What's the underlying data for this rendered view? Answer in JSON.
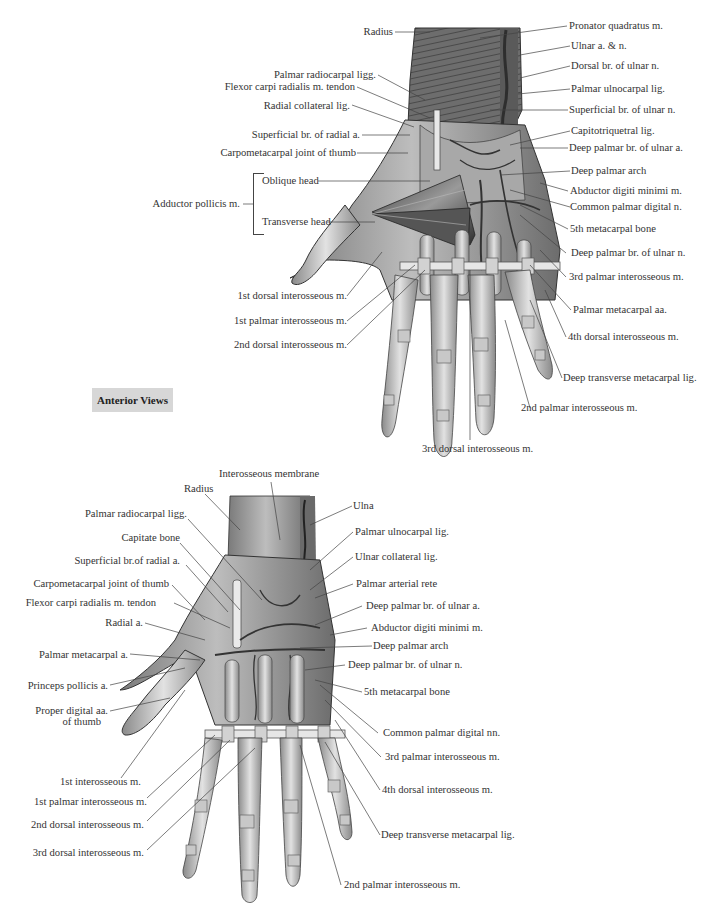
{
  "figure": {
    "view_badge": "Anterior Views",
    "top_view": {
      "labels_left": [
        {
          "id": "radius",
          "text": "Radius"
        },
        {
          "id": "palmar-radiocarpal-ligg",
          "text": "Palmar radiocarpal ligg."
        },
        {
          "id": "flexor-carpi-radialis-tendon",
          "text": "Flexor carpi radialis m. tendon"
        },
        {
          "id": "radial-collateral-lig",
          "text": "Radial collateral lig."
        },
        {
          "id": "superficial-br-radial-a",
          "text": "Superficial br. of radial a."
        },
        {
          "id": "carpometacarpal-joint-thumb",
          "text": "Carpometacarpal joint of thumb"
        },
        {
          "id": "adductor-pollicis",
          "text": "Adductor pollicis m."
        },
        {
          "id": "oblique-head",
          "text": "Oblique head"
        },
        {
          "id": "transverse-head",
          "text": "Transverse head"
        },
        {
          "id": "1st-dorsal-interosseous",
          "text": "1st dorsal interosseous m."
        },
        {
          "id": "1st-palmar-interosseous",
          "text": "1st palmar interosseous m."
        },
        {
          "id": "2nd-dorsal-interosseous",
          "text": "2nd dorsal interosseous m."
        }
      ],
      "labels_right": [
        {
          "id": "pronator-quadratus",
          "text": "Pronator quadratus m."
        },
        {
          "id": "ulnar-a-n",
          "text": "Ulnar a. & n."
        },
        {
          "id": "dorsal-br-ulnar-n",
          "text": "Dorsal br. of ulnar n."
        },
        {
          "id": "palmar-ulnocarpal-lig",
          "text": "Palmar ulnocarpal lig."
        },
        {
          "id": "superficial-br-ulnar-n",
          "text": "Superficial br. of ulnar n."
        },
        {
          "id": "capitotriquetral-lig",
          "text": "Capitotriquetral lig."
        },
        {
          "id": "deep-palmar-br-ulnar-a",
          "text": "Deep palmar br. of ulnar a."
        },
        {
          "id": "deep-palmar-arch",
          "text": "Deep palmar arch"
        },
        {
          "id": "abductor-digiti-minimi",
          "text": "Abductor digiti minimi m."
        },
        {
          "id": "common-palmar-digital-n",
          "text": "Common palmar digital n."
        },
        {
          "id": "5th-metacarpal-bone",
          "text": "5th metacarpal bone"
        },
        {
          "id": "deep-palmar-br-ulnar-n",
          "text": "Deep palmar br. of ulnar n."
        },
        {
          "id": "3rd-palmar-interosseous",
          "text": "3rd palmar interosseous m."
        },
        {
          "id": "palmar-metacarpal-aa",
          "text": "Palmar metacarpal aa."
        },
        {
          "id": "4th-dorsal-interosseous",
          "text": "4th dorsal interosseous m."
        },
        {
          "id": "deep-transverse-metacarpal-lig",
          "text": "Deep transverse metacarpal lig."
        },
        {
          "id": "2nd-palmar-interosseous",
          "text": "2nd palmar interosseous m."
        }
      ],
      "labels_bottom": [
        {
          "id": "3rd-dorsal-interosseous",
          "text": "3rd dorsal interosseous m."
        }
      ]
    },
    "bottom_view": {
      "labels_top": [
        {
          "id": "interosseous-membrane",
          "text": "Interosseous membrane"
        },
        {
          "id": "radius",
          "text": "Radius"
        }
      ],
      "labels_left": [
        {
          "id": "palmar-radiocarpal-ligg",
          "text": "Palmar radiocarpal ligg."
        },
        {
          "id": "capitate-bone",
          "text": "Capitate bone"
        },
        {
          "id": "superficial-br-radial-a",
          "text": "Superficial br.of radial a."
        },
        {
          "id": "carpometacarpal-joint-thumb",
          "text": "Carpometacarpal joint of thumb"
        },
        {
          "id": "flexor-carpi-radialis-tendon",
          "text": "Flexor carpi radialis m. tendon"
        },
        {
          "id": "radial-a",
          "text": "Radial a."
        },
        {
          "id": "palmar-metacarpal-a",
          "text": "Palmar metacarpal a."
        },
        {
          "id": "princeps-pollicis-a",
          "text": "Princeps pollicis a."
        },
        {
          "id": "proper-digital-aa-thumb-1",
          "text": "Proper digital aa."
        },
        {
          "id": "proper-digital-aa-thumb-2",
          "text": "of thumb"
        },
        {
          "id": "1st-interosseous",
          "text": "1st interosseous m."
        },
        {
          "id": "1st-palmar-interosseous",
          "text": "1st palmar interosseous m."
        },
        {
          "id": "2nd-dorsal-interosseous",
          "text": "2nd dorsal interosseous m."
        },
        {
          "id": "3rd-dorsal-interosseous",
          "text": "3rd dorsal interosseous m."
        }
      ],
      "labels_right": [
        {
          "id": "ulna",
          "text": "Ulna"
        },
        {
          "id": "palmar-ulnocarpal-lig",
          "text": "Palmar ulnocarpal lig."
        },
        {
          "id": "ulnar-collateral-lig",
          "text": "Ulnar collateral lig."
        },
        {
          "id": "palmar-arterial-rete",
          "text": "Palmar arterial rete"
        },
        {
          "id": "deep-palmar-br-ulnar-a",
          "text": "Deep palmar br. of ulnar a."
        },
        {
          "id": "abductor-digiti-minimi",
          "text": "Abductor digiti minimi m."
        },
        {
          "id": "deep-palmar-arch",
          "text": "Deep palmar arch"
        },
        {
          "id": "deep-palmar-br-ulnar-n",
          "text": "Deep palmar br. of ulnar n."
        },
        {
          "id": "5th-metacarpal-bone",
          "text": "5th metacarpal bone"
        },
        {
          "id": "common-palmar-digital-nn",
          "text": "Common palmar digital nn."
        },
        {
          "id": "3rd-palmar-interosseous",
          "text": "3rd palmar interosseous m."
        },
        {
          "id": "4th-dorsal-interosseous",
          "text": "4th dorsal interosseous m."
        },
        {
          "id": "deep-transverse-metacarpal-lig",
          "text": "Deep transverse metacarpal lig."
        },
        {
          "id": "2nd-palmar-interosseous",
          "text": "2nd palmar interosseous m."
        }
      ]
    },
    "colors": {
      "illustration_dark": "#4a4a4a",
      "illustration_mid": "#8c8c8c",
      "illustration_light": "#c9c9c9",
      "badge_bg": "#d7d7d7",
      "leader_line": "#444444"
    }
  }
}
